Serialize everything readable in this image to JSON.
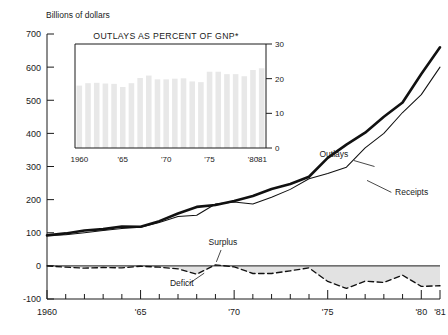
{
  "chart_data": [
    {
      "type": "line",
      "id": "main",
      "title": "",
      "ylabel": "Billions of dollars",
      "xlabel": "",
      "ylim": [
        -100,
        700
      ],
      "xlim": [
        1960,
        1981
      ],
      "yticks": [
        700,
        600,
        500,
        400,
        300,
        200,
        100,
        0,
        -100
      ],
      "ytick_labels": [
        "700",
        "600",
        "500",
        "400",
        "300",
        "200",
        "100",
        "0",
        "-100"
      ],
      "xticks": [
        1960,
        1965,
        1970,
        1975,
        1980,
        1981
      ],
      "xtick_labels": [
        "1960",
        "'65",
        "'70",
        "'75",
        "'80",
        "'81"
      ],
      "grid": false,
      "legend": "annotations-on-plot",
      "x": [
        1960,
        1961,
        1962,
        1963,
        1964,
        1965,
        1966,
        1967,
        1968,
        1969,
        1970,
        1971,
        1972,
        1973,
        1974,
        1975,
        1976,
        1977,
        1978,
        1979,
        1980,
        1981
      ],
      "series": [
        {
          "name": "Outlays",
          "style": "thick-solid",
          "color": "#111111",
          "values": [
            92,
            98,
            107,
            111,
            119,
            118,
            135,
            158,
            178,
            184,
            196,
            211,
            232,
            247,
            269,
            326,
            366,
            402,
            450,
            493,
            579,
            660
          ]
        },
        {
          "name": "Receipts",
          "style": "thin-solid",
          "color": "#111111",
          "values": [
            92,
            94,
            100,
            107,
            113,
            117,
            131,
            149,
            153,
            187,
            193,
            187,
            207,
            231,
            263,
            279,
            298,
            356,
            400,
            463,
            517,
            600
          ]
        },
        {
          "name": "Deficit",
          "style": "dashed",
          "color": "#111111",
          "fill": "#e2e2e2",
          "values": [
            0,
            -4,
            -7,
            -5,
            -6,
            -1,
            -4,
            -9,
            -25,
            3,
            -3,
            -23,
            -23,
            -15,
            -6,
            -47,
            -68,
            -46,
            -50,
            -28,
            -62,
            -60
          ]
        }
      ],
      "annotations": [
        {
          "text": "Outlays",
          "x": 1976.1,
          "y": 330
        },
        {
          "text": "Receipts",
          "x": 1978.6,
          "y": 215
        },
        {
          "text": "Surplus",
          "x": 1969.4,
          "y": 62
        },
        {
          "text": "Deficit",
          "x": 1967.2,
          "y": -62
        }
      ]
    },
    {
      "type": "bar",
      "id": "inset",
      "title": "OUTLAYS AS PERCENT OF GNP*",
      "ylabel": "",
      "xlabel": "",
      "ylim": [
        0,
        30
      ],
      "yticks": [
        0,
        10,
        20,
        30
      ],
      "ytick_labels": [
        "0",
        "10",
        "20",
        "30"
      ],
      "axis_side": "right",
      "xticks": [
        1960,
        1965,
        1970,
        1975,
        1980,
        1981
      ],
      "xtick_labels": [
        "1960",
        "'65",
        "'70",
        "'75",
        "'80",
        "'81"
      ],
      "grid": false,
      "bar_color": "#e8e8e8",
      "categories": [
        1960,
        1961,
        1962,
        1963,
        1964,
        1965,
        1966,
        1967,
        1968,
        1969,
        1970,
        1971,
        1972,
        1973,
        1974,
        1975,
        1976,
        1977,
        1978,
        1979,
        1980,
        1981
      ],
      "values": [
        18.0,
        18.7,
        18.8,
        18.6,
        18.5,
        17.6,
        18.7,
        20.2,
        20.9,
        19.8,
        19.8,
        20.0,
        20.1,
        19.2,
        19.0,
        22.0,
        22.0,
        21.3,
        21.3,
        20.7,
        22.5,
        23.0
      ]
    }
  ],
  "main_chart": {
    "axis_title": "Billions of dollars",
    "y_ticks": [
      "700",
      "600",
      "500",
      "400",
      "300",
      "200",
      "100",
      "0",
      "-100"
    ],
    "x_ticks": [
      "1960",
      "'65",
      "'70",
      "'75",
      "'80",
      "'81"
    ],
    "annotations": {
      "outlays": "Outlays",
      "receipts": "Receipts",
      "surplus": "Surplus",
      "deficit": "Deficit"
    }
  },
  "inset_chart": {
    "title": "OUTLAYS AS PERCENT OF GNP*",
    "y_ticks": [
      "30",
      "20",
      "10",
      "0"
    ],
    "x_ticks": [
      "1960",
      "'65",
      "'70",
      "'75",
      "'80",
      "'81"
    ]
  }
}
